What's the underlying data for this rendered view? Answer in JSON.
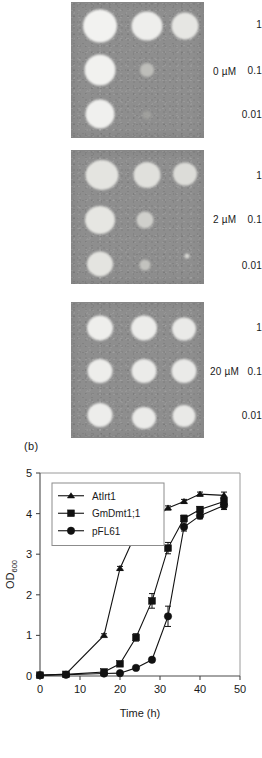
{
  "figure": {
    "panel_a": {
      "dilution_labels": [
        "1",
        "0.1",
        "0.01"
      ],
      "plates": [
        {
          "concentration_label": "0 µM"
        },
        {
          "concentration_label": "2 µM"
        },
        {
          "concentration_label": "20 µM"
        }
      ]
    },
    "panel_b": {
      "tag": "(b)"
    }
  },
  "chart_data": {
    "type": "line",
    "title": "",
    "xlabel": "Time (h)",
    "ylabel": "OD",
    "ylabel_sub": "600",
    "xlim": [
      0,
      50
    ],
    "ylim": [
      0,
      5
    ],
    "xticks": [
      0,
      10,
      20,
      30,
      40,
      50
    ],
    "yticks": [
      0,
      1,
      2,
      3,
      4,
      5
    ],
    "xticklabels": [
      "0",
      "10",
      "20",
      "30",
      "40",
      "50"
    ],
    "yticklabels": [
      "0",
      "1",
      "2",
      "3",
      "4",
      "5"
    ],
    "grid": false,
    "legend_position": "upper left",
    "series": [
      {
        "name": "AtIrt1",
        "marker": "triangle",
        "x": [
          0,
          6.5,
          16,
          20,
          24,
          28,
          32,
          36,
          40,
          46
        ],
        "y": [
          0.02,
          0.05,
          1.0,
          2.65,
          3.52,
          3.83,
          4.14,
          4.3,
          4.48,
          4.45
        ],
        "yerr": [
          0,
          0,
          0.04,
          0.05,
          0.06,
          0.05,
          0.05,
          0.05,
          0.05,
          0.08
        ]
      },
      {
        "name": "GmDmt1;1",
        "marker": "square",
        "x": [
          0,
          6.5,
          16,
          20,
          24,
          28,
          32,
          36,
          40,
          46
        ],
        "y": [
          0.02,
          0.04,
          0.1,
          0.3,
          0.95,
          1.85,
          3.15,
          3.88,
          4.1,
          4.3
        ],
        "yerr": [
          0,
          0,
          0.03,
          0.04,
          0.09,
          0.18,
          0.14,
          0.08,
          0.07,
          0.1
        ]
      },
      {
        "name": "pFL61",
        "marker": "circle",
        "x": [
          0,
          6.5,
          16,
          20,
          24,
          28,
          32,
          36,
          40,
          46
        ],
        "y": [
          0.02,
          0.03,
          0.06,
          0.07,
          0.2,
          0.4,
          1.47,
          3.67,
          3.95,
          4.2
        ],
        "yerr": [
          0,
          0,
          0.02,
          0.03,
          0.04,
          0.05,
          0.25,
          0.1,
          0.08,
          0.1
        ]
      }
    ]
  }
}
